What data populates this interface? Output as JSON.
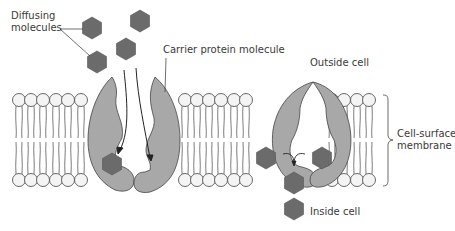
{
  "labels": {
    "diffusing_line1": "Diffusing",
    "diffusing_line2": "molecules",
    "carrier": "Carrier protein molecule",
    "outside": "Outside cell",
    "inside": "Inside cell",
    "membrane_line1": "Cell-surface",
    "membrane_line2": "membrane"
  },
  "colors": {
    "protein_fill": "#a8a8a8",
    "molecule_fill": "#6b6b6b",
    "head_fill": "#f4f4f4",
    "stroke": "#444444"
  }
}
